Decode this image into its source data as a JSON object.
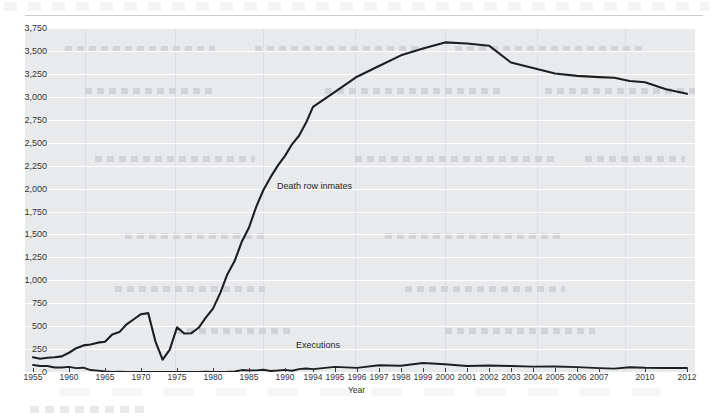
{
  "chart_data": {
    "type": "line",
    "title": "",
    "xlabel": "Year",
    "ylabel": "",
    "ylim": [
      0,
      3750
    ],
    "ytick_step": 250,
    "grid": true,
    "legend_position": "inline-annotation",
    "ytick_labels": [
      "3,750",
      "3,500",
      "3,250",
      "3,000",
      "2,750",
      "2,500",
      "2,250",
      "2,000",
      "1,750",
      "1,500",
      "1,250",
      "1,000",
      "750",
      "500",
      "250",
      "0"
    ],
    "xtick_labels": [
      "1955",
      "1960",
      "1965",
      "1970",
      "1975",
      "1980",
      "1985",
      "1990",
      "1994",
      "1995",
      "1996",
      "1997",
      "1998",
      "1999",
      "2000",
      "2001",
      "2002",
      "2003",
      "2004",
      "2005",
      "2006",
      "2007",
      "2010",
      "2012"
    ],
    "x_axis_note": "Five-year intervals from 1955 to 1990, then annual 1994-2007, then 2010 and 2012",
    "series": [
      {
        "name": "Death row inmates",
        "color": "#1d1f21",
        "x": [
          1955,
          1956,
          1957,
          1958,
          1959,
          1960,
          1961,
          1962,
          1963,
          1964,
          1965,
          1966,
          1967,
          1968,
          1969,
          1970,
          1971,
          1972,
          1973,
          1974,
          1975,
          1976,
          1977,
          1978,
          1979,
          1980,
          1981,
          1982,
          1983,
          1984,
          1985,
          1986,
          1987,
          1988,
          1989,
          1990,
          1991,
          1992,
          1993,
          1994,
          1995,
          1996,
          1997,
          1998,
          1999,
          2000,
          2001,
          2002,
          2003,
          2004,
          2005,
          2006,
          2007,
          2008,
          2009,
          2010,
          2011,
          2012
        ],
        "values": [
          160,
          145,
          155,
          160,
          170,
          210,
          260,
          290,
          300,
          320,
          330,
          410,
          435,
          520,
          575,
          630,
          642,
          334,
          134,
          244,
          488,
          420,
          423,
          482,
          593,
          691,
          860,
          1066,
          1209,
          1420,
          1575,
          1800,
          1984,
          2124,
          2250,
          2356,
          2482,
          2575,
          2716,
          2890,
          3054,
          3219,
          3335,
          3452,
          3527,
          3593,
          3581,
          3557,
          3374,
          3315,
          3254,
          3228,
          3215,
          3207,
          3173,
          3158,
          3082,
          3033
        ]
      },
      {
        "name": "Executions",
        "color": "#1d1f21",
        "x": [
          1955,
          1956,
          1957,
          1958,
          1959,
          1960,
          1961,
          1962,
          1963,
          1964,
          1965,
          1966,
          1967,
          1968,
          1969,
          1970,
          1971,
          1972,
          1973,
          1974,
          1975,
          1976,
          1977,
          1978,
          1979,
          1980,
          1981,
          1982,
          1983,
          1984,
          1985,
          1986,
          1987,
          1988,
          1989,
          1990,
          1991,
          1992,
          1993,
          1994,
          1995,
          1996,
          1997,
          1998,
          1999,
          2000,
          2001,
          2002,
          2003,
          2004,
          2005,
          2006,
          2007,
          2008,
          2009,
          2010,
          2011,
          2012
        ],
        "values": [
          76,
          65,
          65,
          49,
          49,
          56,
          42,
          47,
          21,
          15,
          7,
          1,
          2,
          0,
          0,
          0,
          0,
          0,
          0,
          0,
          0,
          0,
          1,
          0,
          2,
          0,
          1,
          2,
          5,
          21,
          18,
          18,
          25,
          11,
          16,
          23,
          14,
          31,
          38,
          31,
          56,
          45,
          74,
          68,
          98,
          85,
          66,
          71,
          65,
          59,
          60,
          53,
          42,
          37,
          52,
          46,
          43,
          43
        ]
      }
    ],
    "annotations": [
      {
        "text": "Death row inmates",
        "near_x": 1986,
        "near_y": 2100
      },
      {
        "text": "Executions",
        "near_x": 1993,
        "near_y": 160
      }
    ]
  },
  "axis": {
    "x_title": "Year"
  }
}
